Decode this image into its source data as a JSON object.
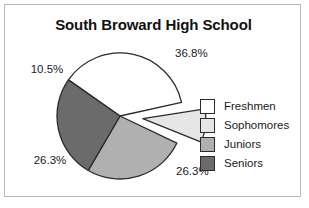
{
  "chart_data": {
    "type": "pie",
    "title": "South Broward High School",
    "xlabel": "",
    "ylabel": "",
    "legend_position": "right",
    "grid": false,
    "categories": [
      "Freshmen",
      "Sophomores",
      "Juniors",
      "Seniors"
    ],
    "values": [
      36.8,
      10.5,
      26.3,
      26.3
    ],
    "data_labels": [
      "36.8%",
      "10.5%",
      "26.3%",
      "26.3%"
    ],
    "slice_colors": [
      "#ffffff",
      "#e6e6e6",
      "#b0b0b0",
      "#6b6b6b"
    ],
    "exploded_slice": "Sophomores",
    "series": [
      {
        "name": "Enrollment share",
        "values": [
          36.8,
          10.5,
          26.3,
          26.3
        ]
      }
    ],
    "slices": [
      {
        "label": "Freshmen",
        "value": 36.8,
        "data_label": "36.8%",
        "color": "#ffffff",
        "exploded": false
      },
      {
        "label": "Sophomores",
        "value": 10.5,
        "data_label": "10.5%",
        "color": "#e6e6e6",
        "exploded": true
      },
      {
        "label": "Juniors",
        "value": 26.3,
        "data_label": "26.3%",
        "color": "#b0b0b0",
        "exploded": false
      },
      {
        "label": "Seniors",
        "value": 26.3,
        "data_label": "26.3%",
        "color": "#6b6b6b",
        "exploded": false
      }
    ]
  },
  "chart": {
    "title": "South Broward High School",
    "labels": {
      "freshmen_pct": "36.8%",
      "sophomores_pct": "10.5%",
      "juniors_pct": "26.3%",
      "seniors_pct": "26.3%"
    }
  },
  "legend": {
    "items": [
      {
        "label": "Freshmen",
        "color": "#ffffff"
      },
      {
        "label": "Sophomores",
        "color": "#e6e6e6"
      },
      {
        "label": "Juniors",
        "color": "#b0b0b0"
      },
      {
        "label": "Seniors",
        "color": "#6b6b6b"
      }
    ]
  },
  "colors": {
    "outline": "#2b2b2b",
    "frame": "#b9b9b9",
    "text": "#1a1a1a",
    "background": "#ffffff"
  }
}
